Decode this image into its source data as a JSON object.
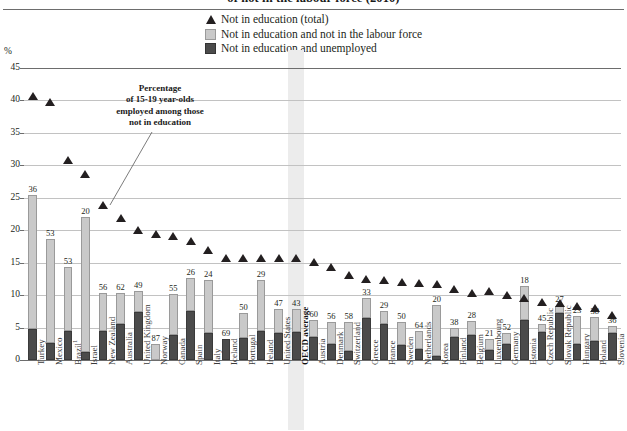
{
  "title": "of not in the labour force (2010)",
  "legend": {
    "position": "top-center",
    "items": [
      {
        "marker": "triangle-marker",
        "label": "Not in education (total)",
        "color": "#231f20"
      },
      {
        "marker": "light-square-swatch",
        "label": "Not in education and not in the labour force",
        "color": "#c9c9c9"
      },
      {
        "marker": "dark-square-swatch",
        "label": "Not in education and unemployed",
        "color": "#4b4b4b"
      }
    ]
  },
  "annotation": {
    "text": "Percentage of 15-19 year-olds employed among those not in education",
    "lines": [
      "Percentage",
      "of 15-19 year-olds",
      "employed among those",
      "not in education"
    ],
    "points_to": "Israel"
  },
  "axis": {
    "y_unit": "%",
    "ticks": [
      0,
      5,
      10,
      15,
      20,
      25,
      30,
      35,
      40,
      45
    ]
  },
  "highlight": {
    "category": "OECD average",
    "color": "#ececec"
  },
  "chart_data": {
    "type": "bar",
    "title": "of not in the labour force (2010)",
    "xlabel": "",
    "ylabel": "%",
    "ylim": [
      0,
      45
    ],
    "grid": true,
    "stacked": true,
    "categories": [
      "Turkey",
      "Mexico",
      "Brazil¹",
      "Israel",
      "New Zealand",
      "Australia",
      "United Kingdom",
      "Norway",
      "Canada",
      "Spain",
      "Italy",
      "Iceland",
      "Portugal",
      "Ireland",
      "United States",
      "OECD average",
      "Austria",
      "Denmark",
      "Switzerland",
      "Greece",
      "France",
      "Sweden",
      "Netherlands",
      "Korea",
      "Finland",
      "Belgium",
      "Luxembourg",
      "Germany",
      "Estonia",
      "Czech Republic",
      "Slovak Republic",
      "Hungary",
      "Poland",
      "Slovenia"
    ],
    "series": [
      {
        "name": "Not in education and unemployed",
        "color": "#4b4b4b",
        "values": [
          4.8,
          2.6,
          4.5,
          1.2,
          4.4,
          5.5,
          7.4,
          0.0,
          3.9,
          7.6,
          4.1,
          3.3,
          3.4,
          4.5,
          4.1,
          4.3,
          3.6,
          2.4,
          1.4,
          6.4,
          5.5,
          2.3,
          1.7,
          0.6,
          3.6,
          3.9,
          1.6,
          2.4,
          6.2,
          4.3,
          7.2,
          2.4,
          3.0,
          4.2
        ]
      },
      {
        "name": "Not in education and not in the labour force",
        "color": "#c9c9c9",
        "values": [
          20.7,
          16.1,
          9.8,
          20.8,
          6.0,
          4.9,
          3.2,
          2.5,
          6.3,
          5.0,
          8.3,
          0.0,
          3.9,
          7.8,
          3.8,
          3.5,
          2.6,
          3.5,
          4.4,
          3.1,
          2.1,
          3.5,
          2.7,
          7.9,
          1.4,
          2.1,
          1.7,
          1.8,
          5.2,
          1.2,
          1.2,
          4.4,
          3.7,
          1.1
        ]
      }
    ],
    "marker_series": {
      "name": "Not in education (total)",
      "color": "#231f20",
      "marker": "triangle",
      "values": [
        40.0,
        39.1,
        30.1,
        27.9,
        23.2,
        21.2,
        19.4,
        18.8,
        18.4,
        17.6,
        16.2,
        15.0,
        15.0,
        15.0,
        15.0,
        15.0,
        14.4,
        13.7,
        12.4,
        11.8,
        11.7,
        11.4,
        11.2,
        11.0,
        10.3,
        9.6,
        9.9,
        9.4,
        8.9,
        8.3,
        8.1,
        7.6,
        7.3,
        6.2
      ]
    },
    "data_labels": {
      "description": "Percentage of 15-19 year-olds employed among those not in education",
      "values": [
        36,
        53,
        53,
        20,
        56,
        62,
        49,
        87,
        55,
        26,
        24,
        69,
        50,
        29,
        47,
        43,
        60,
        56,
        58,
        33,
        29,
        50,
        64,
        20,
        38,
        28,
        21,
        52,
        18,
        45,
        27,
        23,
        38,
        36
      ]
    }
  }
}
